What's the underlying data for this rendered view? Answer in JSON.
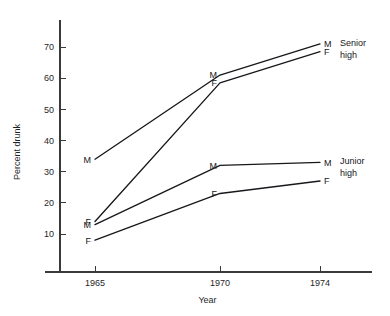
{
  "chart_data": {
    "type": "line",
    "title": "",
    "xlabel": "Year",
    "ylabel": "Percent drunk",
    "x": [
      1965,
      1970,
      1974
    ],
    "categories": [
      "1965",
      "1970",
      "1974"
    ],
    "xlim": [
      1963.5,
      1975.5
    ],
    "ylim": [
      5,
      75
    ],
    "yticks": [
      10,
      20,
      30,
      40,
      50,
      60,
      70
    ],
    "ytick_labels": [
      "10",
      "20",
      "30",
      "40",
      "50",
      "60",
      "70"
    ],
    "xticks": [
      1965,
      1970,
      1974
    ],
    "xtick_labels": [
      "1965",
      "1970",
      "1974"
    ],
    "grid": false,
    "legend_position": "right-inline-annotations",
    "series": [
      {
        "name": "Senior high Male",
        "group": "Senior high",
        "sex": "M",
        "values": [
          34,
          61,
          71
        ],
        "start_label": "M",
        "end_label": "M"
      },
      {
        "name": "Senior high Female",
        "group": "Senior high",
        "sex": "F",
        "values": [
          14,
          58.5,
          68.5
        ],
        "start_label": "F",
        "end_label": "F"
      },
      {
        "name": "Junior high Male",
        "group": "Junior high",
        "sex": "M",
        "values": [
          13,
          32,
          33
        ],
        "start_label": "M",
        "end_label": "M"
      },
      {
        "name": "Junior high Female",
        "group": "Junior high",
        "sex": "F",
        "values": [
          8,
          23,
          27
        ],
        "start_label": "F",
        "end_label": "F"
      }
    ],
    "annotations": [
      {
        "text_line1": "Senior",
        "text_line2": "high",
        "at_value": 71,
        "group": "Senior high"
      },
      {
        "text_line1": "Junior",
        "text_line2": "high",
        "at_value": 33,
        "group": "Junior high"
      }
    ],
    "colors": {
      "line": "#17171c",
      "axis": "#3a3a3a",
      "text": "#1f1f1f",
      "background": "#ffffff"
    }
  }
}
